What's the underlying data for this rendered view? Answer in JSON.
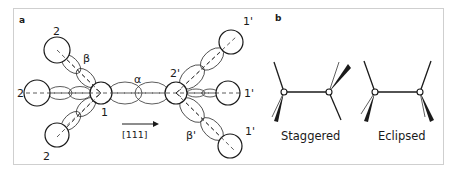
{
  "figure": {
    "panel_a": {
      "label": "a",
      "atom_labels": {
        "left_upper": "2",
        "left_middle": "2",
        "left_lower": "2",
        "center_left": "1",
        "center_right": "2'",
        "right_upper": "1'",
        "right_middle": "1'",
        "right_lower": "1'"
      },
      "bond_labels": {
        "alpha": "α",
        "beta": "β",
        "beta_prime": "β'"
      },
      "direction_label": "[111]"
    },
    "panel_b": {
      "label": "b",
      "captions": {
        "staggered": "Staggered",
        "eclipsed": "Eclipsed"
      }
    },
    "colors": {
      "ink": "#1a1a1a",
      "frame": "#cfcfcf",
      "background": "#ffffff"
    }
  }
}
